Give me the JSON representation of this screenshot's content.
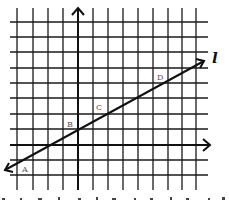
{
  "figure": {
    "type": "coordinate-grid-with-line",
    "line_label": "l",
    "points": [
      {
        "label": "A",
        "x": 24,
        "y": 172
      },
      {
        "label": "B",
        "x": 67,
        "y": 123
      },
      {
        "label": "C",
        "x": 96,
        "y": 104
      },
      {
        "label": "D",
        "x": 155,
        "y": 74
      }
    ],
    "grid": {
      "vertical_x": [
        17,
        33,
        48,
        63,
        78,
        93,
        108,
        123,
        138,
        153,
        168,
        182,
        196
      ],
      "horizontal_y": [
        22,
        37,
        52,
        68,
        83,
        98,
        114,
        129,
        145,
        160,
        175
      ],
      "y_axis_x": 78,
      "x_axis_y": 145
    },
    "line": {
      "x1": 5,
      "y1": 170,
      "x2": 204,
      "y2": 61
    },
    "colors": {
      "grid": "#1a1a1a",
      "axis": "#111111",
      "line": "#111111",
      "point_label": "#555555"
    }
  }
}
